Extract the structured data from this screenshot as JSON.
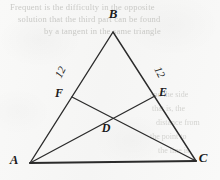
{
  "figure": {
    "kind": "euclidean-geometry-diagram",
    "background_color": "#f8f8f7",
    "ink_color": "#2b2b2b",
    "vertices": [
      {
        "id": "B",
        "label": "B",
        "x": 113,
        "y": 32,
        "label_x": 113,
        "label_y": 14,
        "role": "apex-vertex"
      },
      {
        "id": "A",
        "label": "A",
        "x": 30,
        "y": 163,
        "label_x": 14,
        "label_y": 160,
        "role": "base-left-vertex"
      },
      {
        "id": "C",
        "label": "C",
        "x": 196,
        "y": 161,
        "label_x": 203,
        "label_y": 158,
        "role": "base-right-vertex"
      }
    ],
    "points": [
      {
        "id": "F",
        "label": "F",
        "x": 72,
        "y": 97,
        "label_x": 59,
        "label_y": 93,
        "on": "AB",
        "role": "point-on-side-ab"
      },
      {
        "id": "E",
        "label": "E",
        "x": 155,
        "y": 96,
        "label_x": 163,
        "label_y": 92,
        "on": "BC",
        "role": "point-on-side-bc"
      },
      {
        "id": "D",
        "label": "D",
        "x": 110,
        "y": 124,
        "label_x": 106,
        "label_y": 128,
        "on": "AE∩FC",
        "role": "cevian-intersection"
      }
    ],
    "segments": [
      {
        "id": "AB",
        "from": "A",
        "to": "B",
        "kind": "triangle-side",
        "width": 1.4
      },
      {
        "id": "BC",
        "from": "B",
        "to": "C",
        "kind": "triangle-side",
        "width": 1.4
      },
      {
        "id": "AC",
        "from": "A",
        "to": "C",
        "kind": "triangle-base",
        "width": 2.0
      },
      {
        "id": "FC",
        "from": "F",
        "to": "C",
        "kind": "cevian",
        "width": 1.3
      },
      {
        "id": "AE",
        "from": "A",
        "to": "E",
        "kind": "cevian",
        "width": 1.3
      }
    ],
    "measures": [
      {
        "id": "BF",
        "text": "12",
        "segment": "BF",
        "x": 60,
        "y": 72,
        "rotation": -63,
        "role": "length-label-left"
      },
      {
        "id": "BE",
        "text": "12",
        "segment": "BE",
        "x": 160,
        "y": 72,
        "rotation": 63,
        "role": "length-label-right"
      }
    ]
  },
  "ghost_text": {
    "note": "faint bleed-through from reverse side of scanned page",
    "top_lines": [
      "Frequent is the difficulty in the opposite",
      "solution that the third part can be found",
      "by a tangent in the same triangle"
    ],
    "right_lines": [
      "and the side",
      "that is, the",
      "distance from",
      "the point to",
      "the line is"
    ]
  }
}
